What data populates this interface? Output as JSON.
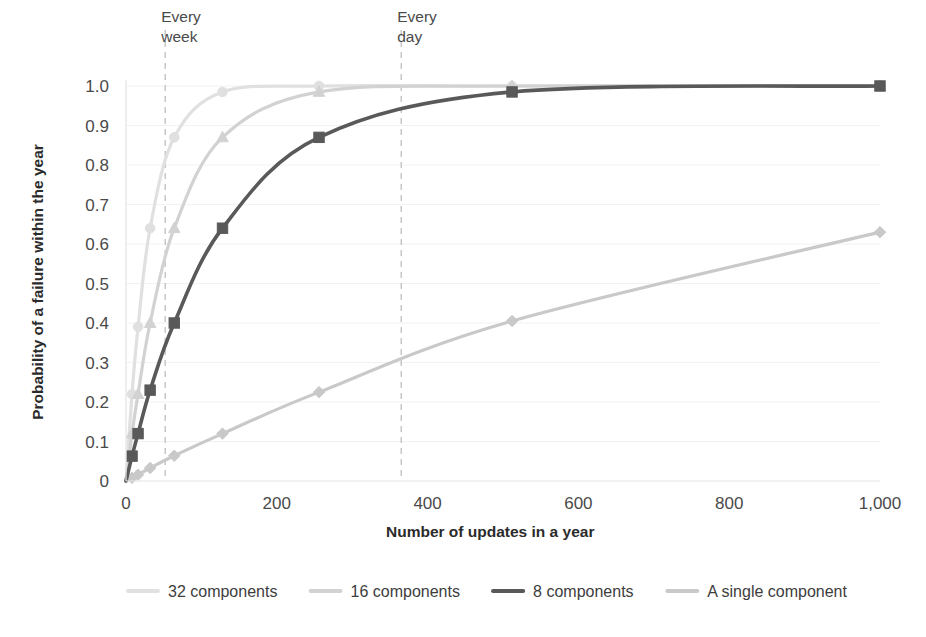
{
  "chart_data": {
    "type": "line",
    "title": "",
    "subtitle": "",
    "xlabel": "Number of updates in a year",
    "ylabel": "Probability of a failure within the year",
    "xlim": [
      0,
      1000
    ],
    "ylim": [
      0,
      1.0
    ],
    "grid": true,
    "legend_position": "bottom",
    "x_ticks": [
      0,
      200,
      400,
      600,
      800,
      1000
    ],
    "x_tick_labels": [
      "0",
      "200",
      "400",
      "600",
      "800",
      "1,000"
    ],
    "y_ticks": [
      0,
      0.1,
      0.2,
      0.3,
      0.4,
      0.5,
      0.6,
      0.7,
      0.8,
      0.9,
      1.0
    ],
    "y_tick_labels": [
      "0",
      "0.1",
      "0.2",
      "0.3",
      "0.4",
      "0.5",
      "0.6",
      "0.7",
      "0.8",
      "0.9",
      "1.0"
    ],
    "x": [
      8,
      16,
      32,
      64,
      128,
      256,
      512,
      1000
    ],
    "series": [
      {
        "name": "32 components",
        "color": "#e0e0e0",
        "marker": "circle",
        "width": 3.2,
        "values": [
          0.22,
          0.39,
          0.64,
          0.87,
          0.985,
          1.0,
          1.0,
          1.0
        ]
      },
      {
        "name": "16 components",
        "color": "#d2d2d2",
        "marker": "triangle",
        "width": 3.2,
        "values": [
          0.12,
          0.22,
          0.4,
          0.64,
          0.87,
          0.985,
          1.0,
          1.0
        ]
      },
      {
        "name": "8 components",
        "color": "#595959",
        "marker": "square",
        "width": 3.6,
        "values": [
          0.063,
          0.12,
          0.23,
          0.4,
          0.64,
          0.87,
          0.985,
          1.0
        ]
      },
      {
        "name": "A single component",
        "color": "#c9c9c9",
        "marker": "diamond",
        "width": 3.2,
        "values": [
          0.008,
          0.016,
          0.033,
          0.064,
          0.12,
          0.225,
          0.405,
          0.63
        ]
      }
    ],
    "annotations": [
      {
        "label_line1": "Every",
        "label_line2": "week",
        "x": 52
      },
      {
        "label_line1": "Every",
        "label_line2": "day",
        "x": 365
      }
    ]
  },
  "legend": {
    "items": [
      {
        "label": "32 components"
      },
      {
        "label": "16 components"
      },
      {
        "label": "8 components"
      },
      {
        "label": "A single component"
      }
    ]
  }
}
